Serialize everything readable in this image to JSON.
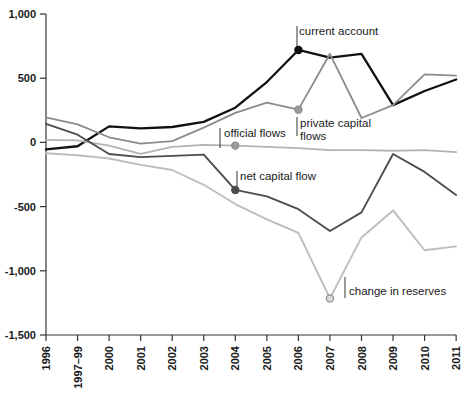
{
  "chart_data": {
    "type": "line",
    "title": "",
    "subtitle": "",
    "xlabel": "",
    "ylabel": "",
    "grid": false,
    "legend_position": "inline-annotations",
    "ylim": [
      -1500,
      1000
    ],
    "yticks": [
      1000,
      500,
      0,
      -500,
      -1000,
      -1500
    ],
    "ytick_labels": [
      "1,000",
      "500",
      "0",
      "-500",
      "-1,000",
      "-1,500"
    ],
    "categories": [
      "1996",
      "1997–99",
      "2000",
      "2001",
      "2002",
      "2003",
      "2004",
      "2005",
      "2006",
      "2007",
      "2008",
      "2009",
      "2010",
      "2011"
    ],
    "series": [
      {
        "name": "current account",
        "color": "#111111",
        "width": 2.3,
        "values": [
          -55,
          -30,
          125,
          110,
          120,
          160,
          270,
          470,
          720,
          660,
          690,
          290,
          400,
          490
        ],
        "marker_index": 8,
        "marker_style": "filled"
      },
      {
        "name": "private capital flows",
        "color": "#8c8c8c",
        "width": 1.8,
        "values": [
          195,
          140,
          40,
          -10,
          10,
          115,
          230,
          310,
          255,
          690,
          190,
          290,
          530,
          520
        ],
        "marker_index": 8,
        "marker_style": "filled"
      },
      {
        "name": "official flows",
        "color": "#b3b3b3",
        "width": 1.8,
        "values": [
          20,
          15,
          -25,
          -90,
          -35,
          -20,
          -25,
          -35,
          -45,
          -60,
          -60,
          -65,
          -60,
          -75
        ],
        "marker_index": 6,
        "marker_style": "filled"
      },
      {
        "name": "net capital flow",
        "color": "#4d4d4d",
        "width": 1.9,
        "values": [
          145,
          60,
          -90,
          -115,
          -105,
          -95,
          -370,
          -420,
          -520,
          -690,
          -545,
          -90,
          -230,
          -410
        ],
        "marker_index": 6,
        "marker_style": "filled"
      },
      {
        "name": "change in reserves",
        "color": "#bdbdbd",
        "width": 1.9,
        "values": [
          -85,
          -100,
          -125,
          -175,
          -215,
          -330,
          -480,
          -600,
          -705,
          -1215,
          -740,
          -530,
          -840,
          -810
        ],
        "marker_index": 9,
        "marker_style": "hollow"
      }
    ],
    "annotations": [
      {
        "text": "current account",
        "series": "current account",
        "at_category": "2006",
        "value": 720,
        "label_x": 299,
        "label_y": 35,
        "leader_x": 297,
        "leader_y1": 26,
        "leader_y2": 46,
        "dot_color": "#111111",
        "dot_fill": "#111111"
      },
      {
        "text": "official flows",
        "series": "official flows",
        "at_category": "2004",
        "value": -25,
        "label_x": 224,
        "label_y": 137,
        "leader_x": 220,
        "leader_y1": 128,
        "leader_y2": 148,
        "dot_color": "#8c8c8c",
        "dot_fill": "#9a9a9a"
      },
      {
        "text": "private capital",
        "text2": "flows",
        "series": "private capital flows",
        "at_category": "2006",
        "value": 255,
        "label_x": 300,
        "label_y": 127,
        "leader_x": 297,
        "leader_y1": 117,
        "leader_y2": 136,
        "dot_color": "#8c8c8c",
        "dot_fill": "#9a9a9a"
      },
      {
        "text": "net capital flow",
        "series": "net capital flow",
        "at_category": "2004",
        "value": -370,
        "label_x": 240,
        "label_y": 180,
        "leader_x": 237,
        "leader_y1": 171,
        "leader_y2": 192,
        "dot_color": "#4d4d4d",
        "dot_fill": "#4d4d4d"
      },
      {
        "text": "change in reserves",
        "series": "change in reserves",
        "at_category": "2007",
        "value": -1215,
        "label_x": 349,
        "label_y": 295,
        "leader_x": 345,
        "leader_y1": 277,
        "leader_y2": 298,
        "dot_color": "#8f8f8f",
        "dot_fill": "#d8d8d8"
      }
    ]
  },
  "axis": {
    "axis_color": "#333333",
    "tick_length": 6
  }
}
